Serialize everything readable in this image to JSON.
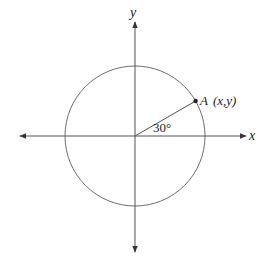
{
  "diagram": {
    "type": "unit-circle",
    "axes": {
      "x_label": "x",
      "y_label": "y",
      "color": "#555555"
    },
    "circle": {
      "center": [
        135,
        136
      ],
      "radius": 70,
      "stroke": "#666666"
    },
    "angle": {
      "label": "30°",
      "degrees": 30
    },
    "point": {
      "name": "A",
      "coords_label": "(x,y)",
      "color": "#222222"
    }
  }
}
